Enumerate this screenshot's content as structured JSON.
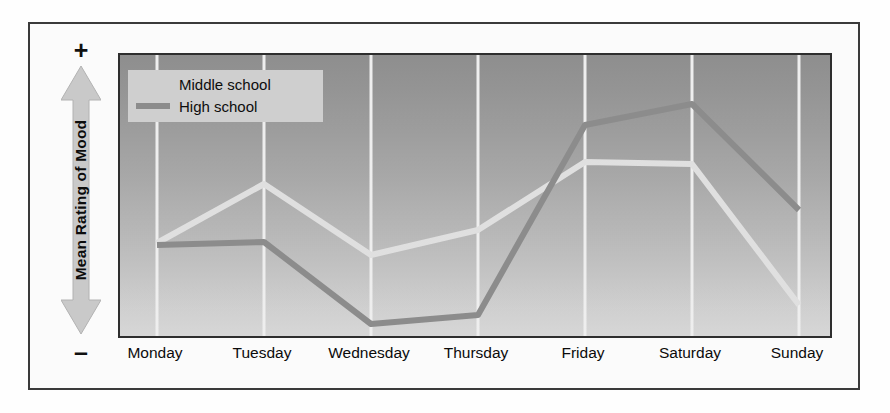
{
  "figure": {
    "background_color": "#fbfbfb",
    "frame_color": "#3a3a3a"
  },
  "y_axis": {
    "title": "Mean Rating of Mood",
    "positive_symbol": "+",
    "negative_symbol": "–",
    "arrow_color": "#c9c9c9",
    "arrow_stroke": "#9d9d9d"
  },
  "legend": {
    "background_color": "#cfcfcf",
    "entries": [
      {
        "label": "Middle school",
        "color": "#e3e3e3"
      },
      {
        "label": "High school",
        "color": "#8c8c8c"
      }
    ]
  },
  "plot": {
    "background_top_color": "#8e8e8e",
    "background_bottom_color": "#dadada",
    "gridline_color": "#f2f2f2",
    "border_color": "#2e2e2e"
  },
  "chart_data": {
    "type": "line",
    "title": "",
    "xlabel": "",
    "ylabel": "Mean Rating of Mood",
    "grid": true,
    "legend_position": "top-left",
    "categories": [
      "Monday",
      "Tuesday",
      "Wednesday",
      "Thursday",
      "Friday",
      "Saturday",
      "Sunday"
    ],
    "ylim": [
      -1,
      1
    ],
    "y_axis_ticks": [
      "–",
      "+"
    ],
    "y_axis_note": "Unlabeled scale; low (–) at bottom to high (+) at top",
    "series": [
      {
        "name": "Middle school",
        "color": "#e3e3e3",
        "values": [
          -0.34,
          0.36,
          -0.06,
          0.12,
          0.56,
          0.54,
          -0.46
        ],
        "pixel_y": [
          241,
          182,
          253,
          228,
          160,
          162,
          303
        ]
      },
      {
        "name": "High school",
        "color": "#8c8c8c",
        "values": [
          -0.17,
          -0.15,
          -0.73,
          -0.67,
          0.66,
          0.81,
          0.2
        ],
        "pixel_y": [
          243,
          240,
          322,
          313,
          123,
          102,
          208
        ]
      }
    ],
    "gridline_x_positions": [
      155,
      262,
      369,
      476,
      583,
      690,
      797
    ]
  }
}
